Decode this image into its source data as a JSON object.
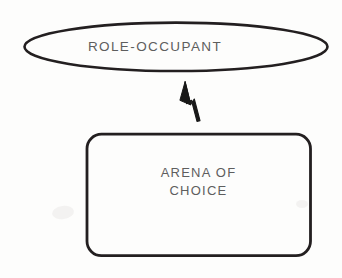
{
  "diagram": {
    "background_color": "#fdfdfc",
    "stroke_color": "#231f20",
    "text_color": "#5e5e5e",
    "nodes": [
      {
        "id": "role-occupant",
        "shape": "ellipse",
        "label": "ROLE-OCCUPANT",
        "cx": 176,
        "cy": 47,
        "rx": 152,
        "ry": 24
      },
      {
        "id": "arena-of-choice",
        "shape": "rounded-rectangle",
        "label_line_1": "ARENA OF",
        "label_line_2": "CHOICE",
        "x": 86,
        "y": 133,
        "width": 225,
        "height": 123,
        "corner_radius": 14
      }
    ],
    "edges": [
      {
        "id": "arena-to-role",
        "from": "arena-of-choice",
        "to": "role-occupant",
        "style": "solid-filled-arrowhead",
        "direction": "upward",
        "arrowhead_tip": [
          185,
          82
        ],
        "tail_end": [
          198,
          120
        ]
      }
    ]
  }
}
